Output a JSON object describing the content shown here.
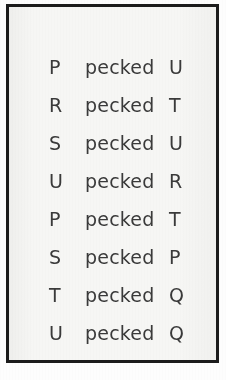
{
  "document": {
    "kind": "scanned-text-list",
    "background_color": "#f7f7f5",
    "border_color": "#1b1b1b",
    "text_color": "#3a3a3a",
    "verb": "pecked",
    "rows": [
      {
        "subject": "P",
        "verb": "pecked",
        "object": "U"
      },
      {
        "subject": "R",
        "verb": "pecked",
        "object": "T"
      },
      {
        "subject": "S",
        "verb": "pecked",
        "object": "U"
      },
      {
        "subject": "U",
        "verb": "pecked",
        "object": "R"
      },
      {
        "subject": "P",
        "verb": "pecked",
        "object": "T"
      },
      {
        "subject": "S",
        "verb": "pecked",
        "object": "P"
      },
      {
        "subject": "T",
        "verb": "pecked",
        "object": "Q"
      },
      {
        "subject": "U",
        "verb": "pecked",
        "object": "Q"
      }
    ]
  }
}
